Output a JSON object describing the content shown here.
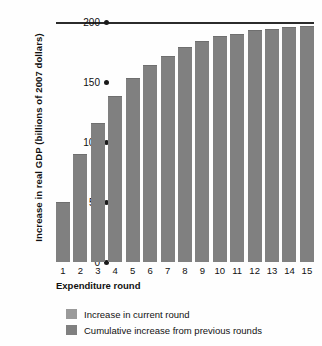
{
  "chart_data": {
    "type": "bar",
    "title": "",
    "xlabel": "Expenditure round",
    "ylabel": "Increase in real GDP (billions of 2007 dollars)",
    "categories": [
      "1",
      "2",
      "3",
      "4",
      "5",
      "6",
      "7",
      "8",
      "9",
      "10",
      "11",
      "12",
      "13",
      "14",
      "15"
    ],
    "values": [
      50,
      90,
      116,
      138,
      153,
      164,
      172,
      179,
      184,
      188,
      190,
      193,
      194,
      196,
      197
    ],
    "series": [
      {
        "name": "Cumulative increase from previous rounds",
        "values": [
          50,
          90,
          116,
          138,
          153,
          164,
          172,
          179,
          184,
          188,
          190,
          193,
          194,
          196,
          197
        ]
      }
    ],
    "ylim": [
      0,
      200
    ],
    "yticks": [
      0,
      50,
      100,
      150,
      200
    ],
    "ytick_labels": [
      "0",
      "50",
      "100",
      "150",
      "200"
    ],
    "grid": false,
    "legend_position": "bottom-left",
    "annotations": [
      "horizontal rule at 200 marks the asymptotic total multiplier effect"
    ],
    "bar_color": "#808080",
    "axis_color": "#2b2b2b"
  },
  "axes": {
    "y_title": "Increase in real GDP (billions of 2007 dollars)",
    "x_title": "Expenditure round",
    "y_ticks": [
      {
        "label": "200",
        "value": 200
      },
      {
        "label": "150",
        "value": 150
      },
      {
        "label": "100",
        "value": 100
      },
      {
        "label": "50",
        "value": 50
      },
      {
        "label": "0",
        "value": 0
      }
    ],
    "x_ticks": [
      "1",
      "2",
      "3",
      "4",
      "5",
      "6",
      "7",
      "8",
      "9",
      "10",
      "11",
      "12",
      "13",
      "14",
      "15"
    ]
  },
  "legend": {
    "items": [
      {
        "label": "Increase in current round",
        "color": "#9a9a9a"
      },
      {
        "label": "Cumulative increase from previous rounds",
        "color": "#808080"
      }
    ]
  }
}
